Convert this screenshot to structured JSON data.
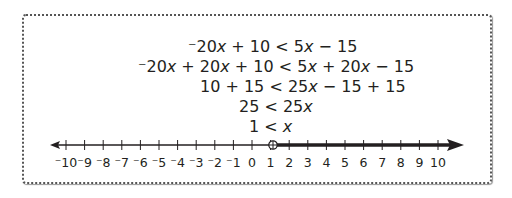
{
  "steps": [
    "⁻20x + 10 < 5x − 15",
    "⁻20x + 20x + 10 < 5x + 20x − 15",
    "10 + 15 < 25x − 15 + 15",
    "25 < 25x",
    "1 < x"
  ],
  "number_line": {
    "min": -10,
    "max": 10,
    "tick_labels": [
      "⁻10",
      "⁻9",
      "⁻8",
      "⁻7",
      "⁻6",
      "⁻5",
      "⁻4",
      "⁻3",
      "⁻2",
      "⁻1",
      "0",
      "1",
      "2",
      "3",
      "4",
      "5",
      "6",
      "7",
      "8",
      "9",
      "10"
    ],
    "open_circle_at": 1,
    "shaded_direction": "right"
  }
}
